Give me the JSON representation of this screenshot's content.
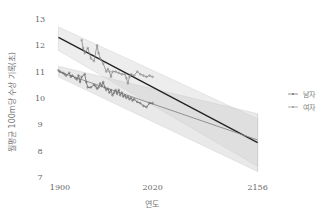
{
  "chart_data": {
    "type": "line",
    "title": "",
    "xlabel": "연도",
    "ylabel": "월평균 100m당 수상 기록(초)",
    "x_ticks": [
      1900,
      2020,
      2156
    ],
    "y_ticks": [
      7,
      8,
      9,
      10,
      11,
      12,
      13
    ],
    "xlim": [
      1898,
      2160
    ],
    "ylim": [
      7,
      13
    ],
    "grid": false,
    "legend_position": "right",
    "legend": [
      "남자",
      "여자"
    ],
    "series": [
      {
        "name": "남자",
        "role": "observed",
        "color": "#666666",
        "x": [
          1898,
          1900,
          1904,
          1906,
          1908,
          1912,
          1914,
          1916,
          1920,
          1922,
          1924,
          1926,
          1928,
          1932,
          1934,
          1936,
          1940,
          1944,
          1946,
          1948,
          1950,
          1952,
          1954,
          1956,
          1958,
          1960,
          1962,
          1964,
          1966,
          1968,
          1970,
          1972,
          1974,
          1976,
          1978,
          1980,
          1982,
          1984,
          1986,
          1988,
          1990,
          1992,
          1994,
          1996,
          2000,
          2004,
          2008,
          2012,
          2016,
          2020
        ],
        "y": [
          11.05,
          11.0,
          10.95,
          10.9,
          10.85,
          10.95,
          10.8,
          10.85,
          10.75,
          10.7,
          10.85,
          10.6,
          10.8,
          10.9,
          10.6,
          10.4,
          10.4,
          10.5,
          10.45,
          10.35,
          10.4,
          10.55,
          10.45,
          10.6,
          10.4,
          10.3,
          10.35,
          10.2,
          10.3,
          10.1,
          10.2,
          10.3,
          10.15,
          10.3,
          10.1,
          10.2,
          10.05,
          10.1,
          10.0,
          10.05,
          9.95,
          10.0,
          9.9,
          9.95,
          9.85,
          9.8,
          9.7,
          9.65,
          9.8,
          9.8
        ]
      },
      {
        "name": "여자",
        "role": "observed",
        "color": "#888888",
        "x": [
          1928,
          1930,
          1932,
          1936,
          1940,
          1944,
          1948,
          1950,
          1952,
          1956,
          1960,
          1962,
          1964,
          1966,
          1968,
          1972,
          1976,
          1980,
          1984,
          1986,
          1988,
          1990,
          1992,
          1996,
          2000,
          2004,
          2008,
          2012,
          2016,
          2020
        ],
        "y": [
          12.2,
          11.9,
          11.7,
          11.9,
          11.5,
          11.4,
          12.0,
          11.7,
          11.5,
          11.3,
          11.0,
          11.1,
          11.0,
          10.8,
          11.0,
          11.0,
          10.95,
          10.9,
          10.9,
          10.75,
          10.55,
          10.8,
          10.9,
          10.85,
          11.0,
          10.9,
          10.85,
          10.8,
          10.85,
          10.8
        ]
      },
      {
        "name": "여자 추세",
        "role": "trend",
        "color": "#222222",
        "x": [
          1898,
          2156
        ],
        "y": [
          12.3,
          8.3
        ],
        "band_upper": [
          12.7,
          9.2
        ],
        "band_lower": [
          11.8,
          7.4
        ]
      },
      {
        "name": "남자 추세",
        "role": "trend",
        "color": "#888888",
        "x": [
          1898,
          2156
        ],
        "y": [
          11.0,
          8.4
        ],
        "band_upper": [
          11.2,
          9.4
        ],
        "band_lower": [
          10.8,
          7.2
        ]
      }
    ]
  },
  "axes": {
    "xlabel": "연도",
    "ylabel": "월평균 100m당 수상 기록(초)"
  },
  "legend": {
    "items": [
      {
        "label": "남자"
      },
      {
        "label": "여자"
      }
    ]
  }
}
